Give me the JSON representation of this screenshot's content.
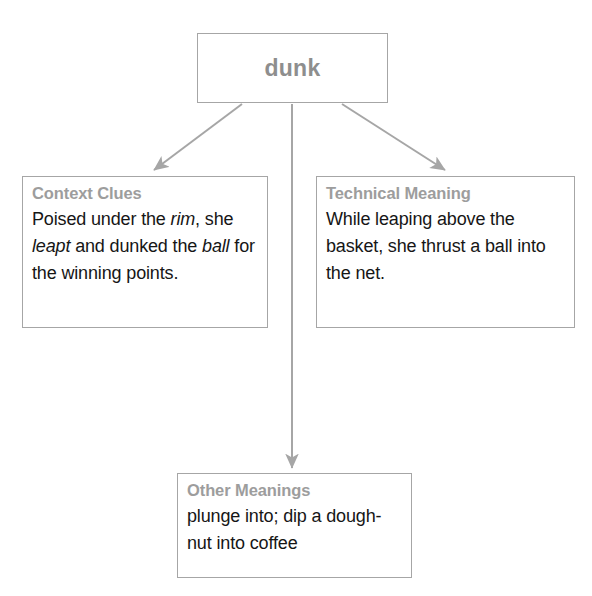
{
  "diagram": {
    "type": "concept-map",
    "root": {
      "label": "dunk"
    },
    "branches": [
      {
        "id": "context-clues",
        "heading": "Context Clues",
        "body_segments": [
          {
            "text": "Poised under the ",
            "italic": false
          },
          {
            "text": "rim",
            "italic": true
          },
          {
            "text": ", she ",
            "italic": false
          },
          {
            "text": "leapt",
            "italic": true
          },
          {
            "text": " and dunked the ",
            "italic": false
          },
          {
            "text": "ball",
            "italic": true
          },
          {
            "text": " for the winning points.",
            "italic": false
          }
        ],
        "body_plain": "Poised under the rim, she leapt and dunked the ball for the winning points."
      },
      {
        "id": "technical-meaning",
        "heading": "Technical Meaning",
        "body_segments": [
          {
            "text": "While leaping above the basket, she thrust a ball into the net.",
            "italic": false
          }
        ],
        "body_plain": "While leaping above the basket, she thrust a ball into the net."
      },
      {
        "id": "other-meanings",
        "heading": "Other Meanings",
        "body_segments": [
          {
            "text": "plunge into; dip a dough-nut into coffee",
            "italic": false
          }
        ],
        "body_plain": "plunge into; dip a dough-nut into coffee"
      }
    ],
    "connectors": [
      {
        "name": "arrow-root-to-context-clues",
        "from": [
          242,
          104
        ],
        "to": [
          152,
          172
        ]
      },
      {
        "name": "arrow-root-to-other-meanings",
        "from": [
          292,
          104
        ],
        "to": [
          292,
          470
        ]
      },
      {
        "name": "arrow-root-to-technical-meaning",
        "from": [
          342,
          104
        ],
        "to": [
          447,
          172
        ]
      }
    ],
    "colors": {
      "border": "#a6a6a6",
      "connector": "#a6a6a6",
      "heading_text": "#9d9d9d",
      "root_text": "#8e8e8e",
      "body_text": "#161616",
      "background": "#ffffff"
    }
  }
}
